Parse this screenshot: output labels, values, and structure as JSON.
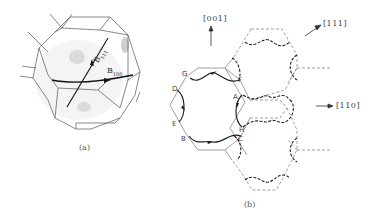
{
  "panel_a": {
    "caption": "(a)",
    "labels": {
      "b111_main": "B",
      "b111_sub": "111",
      "b100_main": "B",
      "b100_sub": "100"
    }
  },
  "panel_b": {
    "caption": "(b)",
    "directions": {
      "d001": "[001]",
      "d111": "[111]",
      "d110": "[110]"
    },
    "points": {
      "A": "A",
      "B": "B",
      "C": "C",
      "D": "D",
      "E": "E",
      "F": "F",
      "G": "G",
      "H": "H"
    }
  },
  "colors": {
    "line": "#555555",
    "path": "#222222",
    "shade": "#bdbdbd"
  }
}
